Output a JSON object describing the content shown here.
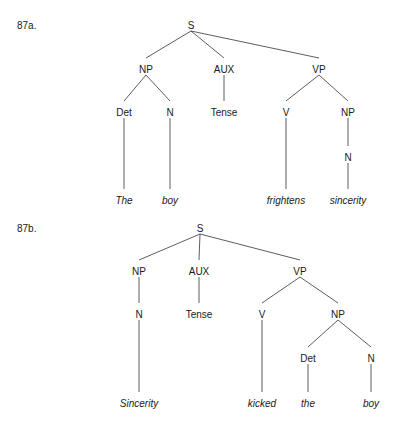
{
  "trees": [
    {
      "label": "87a.",
      "nodes": [
        {
          "id": "S",
          "text": "S",
          "type": "category"
        },
        {
          "id": "NP1",
          "text": "NP",
          "type": "category",
          "parent": "S"
        },
        {
          "id": "AUX",
          "text": "AUX",
          "type": "category",
          "parent": "S"
        },
        {
          "id": "VP",
          "text": "VP",
          "type": "category",
          "parent": "S"
        },
        {
          "id": "Det1",
          "text": "Det",
          "type": "category",
          "parent": "NP1"
        },
        {
          "id": "N1",
          "text": "N",
          "type": "category",
          "parent": "NP1"
        },
        {
          "id": "Tense",
          "text": "Tense",
          "type": "category",
          "parent": "AUX"
        },
        {
          "id": "V",
          "text": "V",
          "type": "category",
          "parent": "VP"
        },
        {
          "id": "NP2",
          "text": "NP",
          "type": "category",
          "parent": "VP"
        },
        {
          "id": "N2",
          "text": "N",
          "type": "category",
          "parent": "NP2"
        },
        {
          "id": "w1",
          "text": "The",
          "type": "word",
          "parent": "Det1"
        },
        {
          "id": "w2",
          "text": "boy",
          "type": "word",
          "parent": "N1"
        },
        {
          "id": "w3",
          "text": "frightens",
          "type": "word",
          "parent": "V"
        },
        {
          "id": "w4",
          "text": "sincerity",
          "type": "word",
          "parent": "N2"
        }
      ]
    },
    {
      "label": "87b.",
      "nodes": [
        {
          "id": "S",
          "text": "S",
          "type": "category"
        },
        {
          "id": "NP1",
          "text": "NP",
          "type": "category",
          "parent": "S"
        },
        {
          "id": "AUX",
          "text": "AUX",
          "type": "category",
          "parent": "S"
        },
        {
          "id": "VP",
          "text": "VP",
          "type": "category",
          "parent": "S"
        },
        {
          "id": "N1",
          "text": "N",
          "type": "category",
          "parent": "NP1"
        },
        {
          "id": "Tense",
          "text": "Tense",
          "type": "category",
          "parent": "AUX"
        },
        {
          "id": "V",
          "text": "V",
          "type": "category",
          "parent": "VP"
        },
        {
          "id": "NP2",
          "text": "NP",
          "type": "category",
          "parent": "VP"
        },
        {
          "id": "Det",
          "text": "Det",
          "type": "category",
          "parent": "NP2"
        },
        {
          "id": "N2",
          "text": "N",
          "type": "category",
          "parent": "NP2"
        },
        {
          "id": "w1",
          "text": "Sincerity",
          "type": "word",
          "parent": "N1"
        },
        {
          "id": "w2",
          "text": "kicked",
          "type": "word",
          "parent": "V"
        },
        {
          "id": "w3",
          "text": "the",
          "type": "word",
          "parent": "Det"
        },
        {
          "id": "w4",
          "text": "boy",
          "type": "word",
          "parent": "N2"
        }
      ]
    }
  ]
}
